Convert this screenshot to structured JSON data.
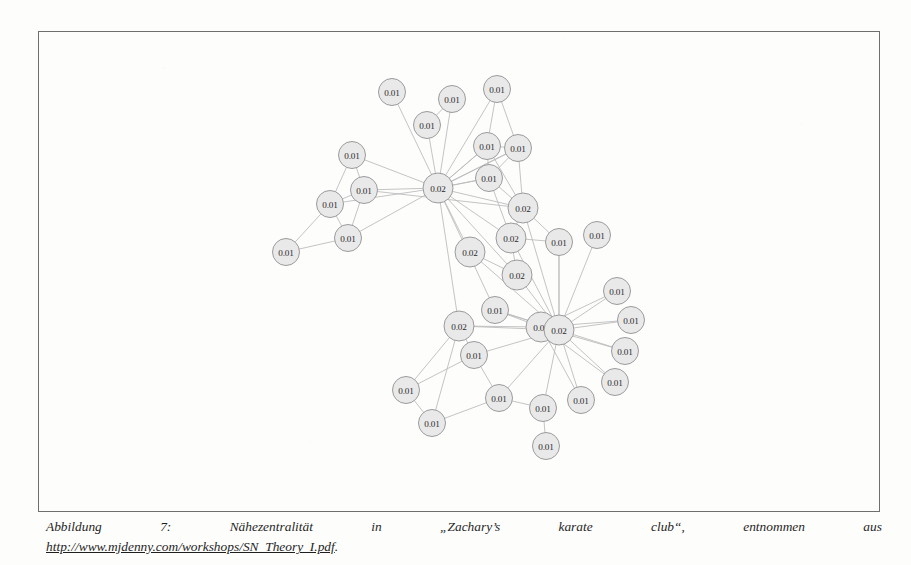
{
  "document": {
    "page_background": "#fdfdfc",
    "frame_border_color": "#6f6f70"
  },
  "figure": {
    "name": "closeness-centrality-network",
    "node_fill": "#e9e9e9",
    "node_stroke": "#9b9b9d",
    "edge_color": "#b9b9bb"
  },
  "caption": {
    "line1_words": [
      "Abbildung",
      "7:",
      "Nähezentralität",
      "in",
      "„Zachary’s",
      "karate",
      "club“,",
      "entnommen",
      "aus"
    ],
    "url": "http://www.mjdenny.com/workshops/SN_Theory_I.pdf",
    "url_trailing": "."
  },
  "chart_data": {
    "type": "graph",
    "metric": "closeness centrality",
    "node_count": 34,
    "edge_count": 78,
    "value_labels": [
      "0.01",
      "0.02"
    ],
    "nodes": [
      {
        "id": 0,
        "label": "0.01",
        "x": 392,
        "y": 92
      },
      {
        "id": 1,
        "label": "0.01",
        "x": 452,
        "y": 99
      },
      {
        "id": 2,
        "label": "0.01",
        "x": 497,
        "y": 89
      },
      {
        "id": 3,
        "label": "0.01",
        "x": 427,
        "y": 125
      },
      {
        "id": 4,
        "label": "0.01",
        "x": 487,
        "y": 146
      },
      {
        "id": 5,
        "label": "0.01",
        "x": 518,
        "y": 148
      },
      {
        "id": 6,
        "label": "0.01",
        "x": 489,
        "y": 178
      },
      {
        "id": 7,
        "label": "0.02",
        "x": 438,
        "y": 188
      },
      {
        "id": 8,
        "label": "0.01",
        "x": 352,
        "y": 155
      },
      {
        "id": 9,
        "label": "0.01",
        "x": 364,
        "y": 190
      },
      {
        "id": 10,
        "label": "0.01",
        "x": 330,
        "y": 204
      },
      {
        "id": 11,
        "label": "0.01",
        "x": 348,
        "y": 238
      },
      {
        "id": 12,
        "label": "0.01",
        "x": 286,
        "y": 252
      },
      {
        "id": 13,
        "label": "0.02",
        "x": 523,
        "y": 208
      },
      {
        "id": 14,
        "label": "0.02",
        "x": 511,
        "y": 238
      },
      {
        "id": 15,
        "label": "0.02",
        "x": 470,
        "y": 252
      },
      {
        "id": 16,
        "label": "0.02",
        "x": 517,
        "y": 275
      },
      {
        "id": 17,
        "label": "0.01",
        "x": 559,
        "y": 242
      },
      {
        "id": 18,
        "label": "0.01",
        "x": 597,
        "y": 235
      },
      {
        "id": 19,
        "label": "0.01",
        "x": 495,
        "y": 310
      },
      {
        "id": 20,
        "label": "0.02",
        "x": 459,
        "y": 326
      },
      {
        "id": 21,
        "label": "0.02",
        "x": 541,
        "y": 327
      },
      {
        "id": 22,
        "label": "0.02",
        "x": 559,
        "y": 330
      },
      {
        "id": 23,
        "label": "0.01",
        "x": 617,
        "y": 291
      },
      {
        "id": 24,
        "label": "0.01",
        "x": 631,
        "y": 320
      },
      {
        "id": 25,
        "label": "0.01",
        "x": 625,
        "y": 351
      },
      {
        "id": 26,
        "label": "0.01",
        "x": 615,
        "y": 382
      },
      {
        "id": 27,
        "label": "0.01",
        "x": 581,
        "y": 400
      },
      {
        "id": 28,
        "label": "0.01",
        "x": 474,
        "y": 355
      },
      {
        "id": 29,
        "label": "0.01",
        "x": 406,
        "y": 390
      },
      {
        "id": 30,
        "label": "0.01",
        "x": 432,
        "y": 423
      },
      {
        "id": 31,
        "label": "0.01",
        "x": 499,
        "y": 398
      },
      {
        "id": 32,
        "label": "0.01",
        "x": 543,
        "y": 408
      },
      {
        "id": 33,
        "label": "0.01",
        "x": 546,
        "y": 446
      }
    ],
    "edges": [
      [
        0,
        7
      ],
      [
        1,
        7
      ],
      [
        2,
        7
      ],
      [
        3,
        7
      ],
      [
        4,
        7
      ],
      [
        5,
        7
      ],
      [
        6,
        7
      ],
      [
        8,
        7
      ],
      [
        9,
        7
      ],
      [
        10,
        7
      ],
      [
        11,
        7
      ],
      [
        7,
        13
      ],
      [
        7,
        14
      ],
      [
        7,
        15
      ],
      [
        7,
        16
      ],
      [
        7,
        19
      ],
      [
        7,
        20
      ],
      [
        7,
        6
      ],
      [
        7,
        4
      ],
      [
        7,
        5
      ],
      [
        8,
        9
      ],
      [
        8,
        10
      ],
      [
        9,
        10
      ],
      [
        9,
        11
      ],
      [
        10,
        11
      ],
      [
        10,
        12
      ],
      [
        11,
        12
      ],
      [
        9,
        13
      ],
      [
        2,
        4
      ],
      [
        2,
        5
      ],
      [
        1,
        3
      ],
      [
        4,
        5
      ],
      [
        4,
        6
      ],
      [
        5,
        6
      ],
      [
        4,
        13
      ],
      [
        5,
        13
      ],
      [
        6,
        13
      ],
      [
        6,
        14
      ],
      [
        13,
        14
      ],
      [
        13,
        17
      ],
      [
        14,
        16
      ],
      [
        14,
        17
      ],
      [
        14,
        22
      ],
      [
        15,
        16
      ],
      [
        15,
        22
      ],
      [
        16,
        22
      ],
      [
        13,
        22
      ],
      [
        17,
        22
      ],
      [
        18,
        22
      ],
      [
        19,
        21
      ],
      [
        19,
        22
      ],
      [
        20,
        21
      ],
      [
        20,
        22
      ],
      [
        20,
        28
      ],
      [
        20,
        29
      ],
      [
        20,
        30
      ],
      [
        21,
        22
      ],
      [
        21,
        23
      ],
      [
        21,
        24
      ],
      [
        21,
        25
      ],
      [
        21,
        26
      ],
      [
        21,
        27
      ],
      [
        22,
        23
      ],
      [
        22,
        24
      ],
      [
        22,
        25
      ],
      [
        22,
        26
      ],
      [
        22,
        27
      ],
      [
        22,
        28
      ],
      [
        22,
        31
      ],
      [
        22,
        32
      ],
      [
        22,
        19
      ],
      [
        22,
        17
      ],
      [
        28,
        29
      ],
      [
        28,
        31
      ],
      [
        29,
        30
      ],
      [
        30,
        31
      ],
      [
        31,
        32
      ],
      [
        32,
        33
      ]
    ]
  }
}
